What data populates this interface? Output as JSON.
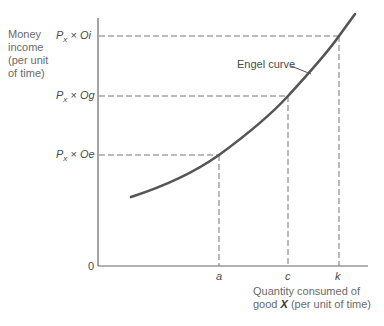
{
  "diagram": {
    "title": "",
    "y_axis": {
      "label_lines": [
        "Money",
        "income",
        "(per unit",
        "of time)"
      ],
      "origin": "0"
    },
    "x_axis": {
      "label_line1": "Quantity consumed of",
      "label_line2_prefix": "good ",
      "label_line2_var": "X",
      "label_line2_suffix": " (per unit of time)"
    },
    "curve_label": "Engel curve",
    "y_ticks": [
      {
        "prefix": "P",
        "sub": "x",
        "mult": " × ",
        "value": "Oi"
      },
      {
        "prefix": "P",
        "sub": "x",
        "mult": " × ",
        "value": "Og"
      },
      {
        "prefix": "P",
        "sub": "x",
        "mult": " × ",
        "value": "Oe"
      }
    ],
    "x_ticks": [
      "a",
      "c",
      "k"
    ],
    "colors": {
      "curve": "#555555",
      "axis": "#666666",
      "dashed": "#777777"
    }
  }
}
